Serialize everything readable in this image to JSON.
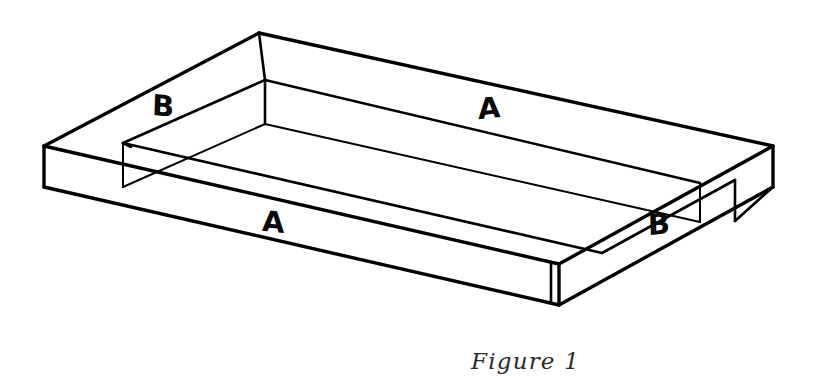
{
  "figure": {
    "caption": "Figure 1",
    "background_color": "#ffffff",
    "line_color": "#000000",
    "label_color": "#0a0a0a",
    "caption_color": "#2b2b2b"
  },
  "parts": [
    {
      "id": "a-top",
      "label": "A",
      "description": "long side board, far / top-right",
      "position": {
        "x": 478,
        "y": 94
      }
    },
    {
      "id": "a-front",
      "label": "A",
      "description": "long side board, near / bottom-left",
      "position": {
        "x": 262,
        "y": 208
      }
    },
    {
      "id": "b-left",
      "label": "B",
      "description": "short end board, upper-left",
      "position": {
        "x": 152,
        "y": 92
      }
    },
    {
      "id": "b-right",
      "label": "B",
      "description": "short end board, lower-right",
      "position": {
        "x": 648,
        "y": 210
      }
    }
  ],
  "geometry": {
    "outer_top": {
      "left": {
        "x": 44,
        "y": 146
      },
      "top": {
        "x": 259,
        "y": 33
      },
      "right": {
        "x": 773,
        "y": 146
      },
      "bottom": {
        "x": 559,
        "y": 264
      }
    },
    "inner_top": {
      "left": {
        "x": 123,
        "y": 143
      },
      "top": {
        "x": 265,
        "y": 80
      },
      "right": {
        "x": 700,
        "y": 183
      },
      "bottom": {
        "x": 560,
        "y": 247
      }
    },
    "board_thickness_px": 40
  }
}
